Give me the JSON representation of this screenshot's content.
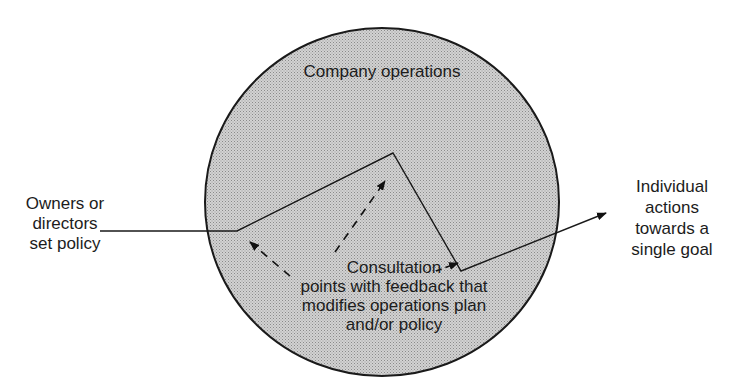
{
  "diagram": {
    "title": "Company operations",
    "left_label": [
      "Owners or",
      "directors",
      "set policy"
    ],
    "right_label": [
      "Individual",
      "actions",
      "towards a",
      "single goal"
    ],
    "center_label": [
      "Consultation",
      "points with feedback that",
      "modifies operations plan",
      "and/or policy"
    ],
    "colors": {
      "circle_fill": "#c6c6c6",
      "circle_stroke": "#1a1a1a",
      "line": "#1a1a1a",
      "background": "#ffffff"
    },
    "circle": {
      "cx": 382,
      "cy": 202,
      "rx": 177,
      "ry": 174
    },
    "solid_path": [
      [
        100,
        231
      ],
      [
        237,
        231
      ],
      [
        393,
        153
      ],
      [
        461,
        271
      ],
      [
        608,
        212
      ]
    ],
    "dashed_arrows": [
      {
        "from": [
          290,
          276
        ],
        "to": [
          250,
          242
        ]
      },
      {
        "from": [
          335,
          252
        ],
        "to": [
          385,
          181
        ]
      },
      {
        "from": [
          436,
          271
        ],
        "to": [
          458,
          263
        ]
      }
    ]
  }
}
